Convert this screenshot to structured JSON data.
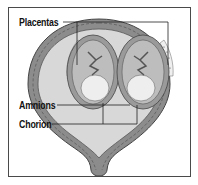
{
  "diagram": {
    "title": "",
    "labels": [
      {
        "id": "placentas",
        "text": "Placentas"
      },
      {
        "id": "amnions",
        "text": "Amnions"
      },
      {
        "id": "chorion",
        "text": "Chorion"
      }
    ],
    "colors": {
      "uterus_wall": "#8a8a8a",
      "uterus_wall_dark": "#5a5a5a",
      "cavity": "#d9d9d9",
      "sac": "#a9a9a9",
      "fetus": "#ececec",
      "frame_border": "#4a4a4a",
      "leader_line": "#222222"
    }
  }
}
